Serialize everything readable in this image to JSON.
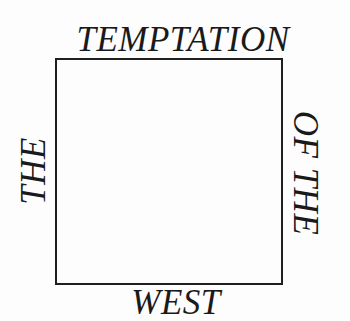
{
  "cover": {
    "title_parts": {
      "top": "TEMPTATION",
      "left": "THE",
      "right": "OF THE",
      "bottom": "WEST"
    },
    "colors": {
      "ink": "#1a1a1a",
      "background": "#fdfdfd"
    }
  }
}
